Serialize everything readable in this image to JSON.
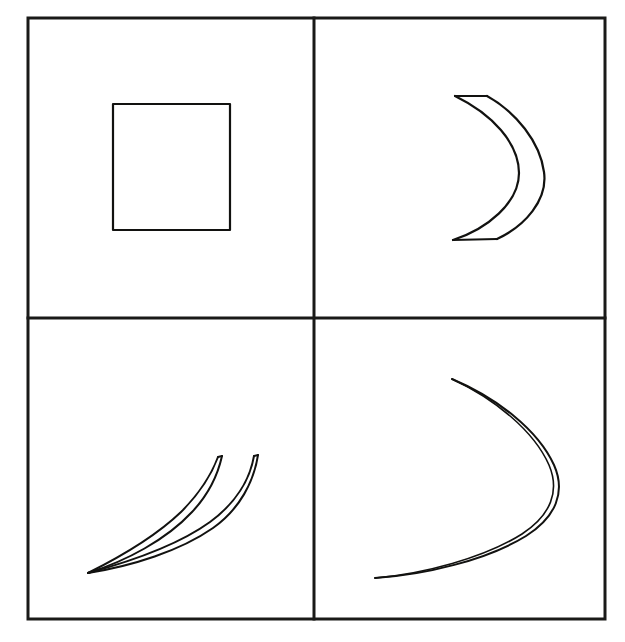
{
  "figure": {
    "title": "Four-panel shape deformation figure",
    "background_color": "#ffffff",
    "ink_color": "#121210",
    "frame_color": "#1a1a18",
    "width": 625,
    "height": 642,
    "panel_count": 4,
    "layout": "2x2 grid",
    "frame": {
      "x": 28,
      "y": 18,
      "width": 577,
      "height": 601,
      "stroke_width": 3
    },
    "divider_vertical_x": 314,
    "divider_horizontal_y": 318,
    "divider_stroke_width": 3
  },
  "panels": [
    {
      "id": "panel-top-left",
      "position": "top-left",
      "shape_name": "square",
      "description": "Plain square outline, unfilled",
      "stroke_width": 2.2,
      "bbox": {
        "x": 113,
        "y": 104,
        "width": 117,
        "height": 126
      }
    },
    {
      "id": "panel-top-right",
      "position": "top-right",
      "shape_name": "crescent",
      "description": "Crescent lune opening to the left, two arcs meeting at upper and lower cusps",
      "stroke_width": 2.2,
      "cusp_top": [
        455,
        95
      ],
      "cusp_bottom": [
        453,
        240
      ],
      "outer_arc_extreme_x": 545,
      "inner_arc_extreme_x": 520
    },
    {
      "id": "panel-bottom-left",
      "position": "bottom-left",
      "shape_name": "compressed-crescent",
      "description": "Crescent compressed and sheared into a narrow sickle, arcs crossing near the middle",
      "stroke_width": 2.0,
      "cusp_lower_left": [
        88,
        573
      ],
      "tip_left": [
        222,
        456
      ],
      "tip_right": [
        258,
        455
      ]
    },
    {
      "id": "panel-bottom-right",
      "position": "bottom-right",
      "shape_name": "collapsed-crescent",
      "description": "Crescent collapsed so the two arcs nearly coincide, forming a single thin bow opening left",
      "stroke_width": 2.0,
      "tip_top": [
        452,
        379
      ],
      "tip_bottom_left": [
        375,
        578
      ],
      "bulge_right_x": 560
    }
  ],
  "chart_data": {
    "type": "diagram",
    "title": "Four-panel shape deformation figure",
    "panels": [
      {
        "label": "top-left",
        "shape": "square",
        "arcs": 0,
        "closed": true
      },
      {
        "label": "top-right",
        "shape": "crescent",
        "arcs": 2,
        "closed": true
      },
      {
        "label": "bottom-left",
        "shape": "compressed crescent",
        "arcs": 2,
        "closed": false
      },
      {
        "label": "bottom-right",
        "shape": "collapsed crescent",
        "arcs": 2,
        "closed": false
      }
    ]
  }
}
